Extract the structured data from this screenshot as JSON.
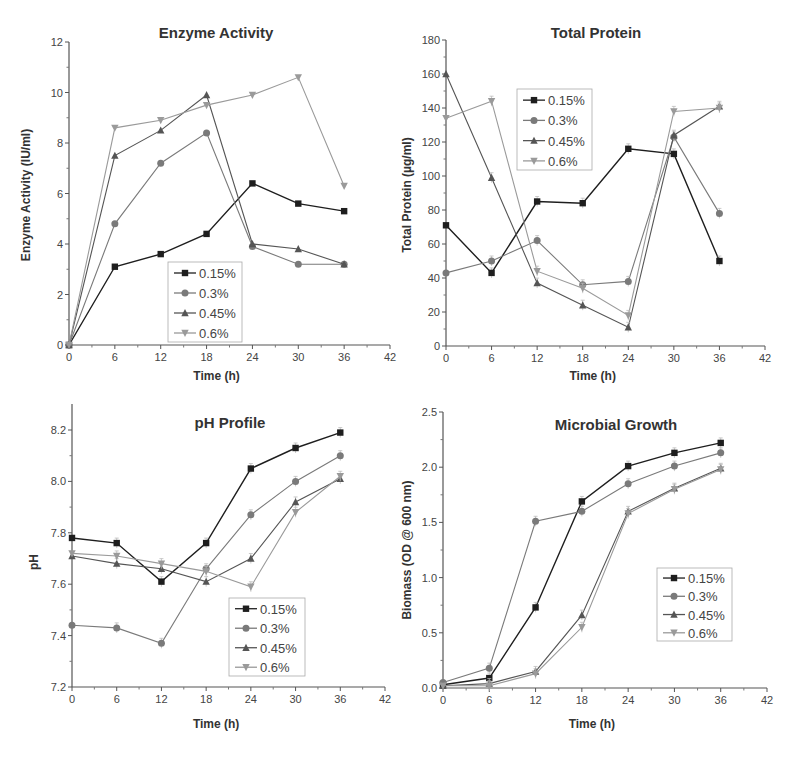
{
  "figure": {
    "series_styles": [
      {
        "name": "0.15%",
        "color": "#1e1e1e",
        "marker": "square"
      },
      {
        "name": "0.3%",
        "color": "#7a7a7a",
        "marker": "circle"
      },
      {
        "name": "0.45%",
        "color": "#555555",
        "marker": "triangle-up"
      },
      {
        "name": "0.6%",
        "color": "#9a9a9a",
        "marker": "triangle-down"
      }
    ]
  },
  "chart_data": [
    {
      "type": "line",
      "title": "Enzyme Activity",
      "xlabel": "Time (h)",
      "ylabel": "Enzyme Activity (IU/ml)",
      "x": [
        0,
        6,
        12,
        18,
        24,
        30,
        36
      ],
      "xlim": [
        0,
        42
      ],
      "ylim": [
        0,
        12
      ],
      "xticks": [
        "0",
        "6",
        "12",
        "18",
        "24",
        "30",
        "36",
        "42"
      ],
      "yticks": [
        "0",
        "2",
        "4",
        "6",
        "8",
        "10",
        "12"
      ],
      "legend_position": "lower center",
      "grid": false,
      "series": [
        {
          "name": "0.15%",
          "values": [
            0,
            3.1,
            3.6,
            4.4,
            6.4,
            5.6,
            5.3
          ]
        },
        {
          "name": "0.3%",
          "values": [
            0,
            4.8,
            7.2,
            8.4,
            3.9,
            3.2,
            3.2
          ]
        },
        {
          "name": "0.45%",
          "values": [
            0,
            7.5,
            8.5,
            9.9,
            4.0,
            3.8,
            3.2
          ]
        },
        {
          "name": "0.6%",
          "values": [
            0,
            8.6,
            8.9,
            9.5,
            9.9,
            10.6,
            6.3
          ]
        }
      ]
    },
    {
      "type": "line",
      "title": "Total Protein",
      "xlabel": "Time (h)",
      "ylabel": "Total Protein (µg/ml)",
      "x": [
        0,
        6,
        12,
        18,
        24,
        30,
        36
      ],
      "xlim": [
        0,
        42
      ],
      "ylim": [
        0,
        180
      ],
      "xticks": [
        "0",
        "6",
        "12",
        "18",
        "24",
        "30",
        "36",
        "42"
      ],
      "yticks": [
        "0",
        "20",
        "40",
        "60",
        "80",
        "100",
        "120",
        "140",
        "160",
        "180"
      ],
      "legend_position": "upper left",
      "grid": false,
      "error_bars": true,
      "series": [
        {
          "name": "0.15%",
          "values": [
            71,
            43,
            85,
            84,
            116,
            113,
            50
          ]
        },
        {
          "name": "0.3%",
          "values": [
            43,
            50,
            62,
            36,
            38,
            123,
            78
          ]
        },
        {
          "name": "0.45%",
          "values": [
            160,
            99,
            37,
            24,
            11,
            124,
            141
          ]
        },
        {
          "name": "0.6%",
          "values": [
            134,
            144,
            44,
            34,
            18,
            138,
            140
          ]
        }
      ]
    },
    {
      "type": "line",
      "title": "pH Profile",
      "xlabel": "Time (h)",
      "ylabel": "pH",
      "x": [
        0,
        6,
        12,
        18,
        24,
        30,
        36
      ],
      "xlim": [
        0,
        42
      ],
      "ylim": [
        7.2,
        8.3
      ],
      "xticks": [
        "0",
        "6",
        "12",
        "18",
        "24",
        "30",
        "36",
        "42"
      ],
      "yticks": [
        "7.2",
        "7.4",
        "7.6",
        "7.8",
        "8.0",
        "8.2"
      ],
      "legend_position": "lower right",
      "grid": false,
      "error_bars": true,
      "series": [
        {
          "name": "0.15%",
          "values": [
            7.78,
            7.76,
            7.61,
            7.76,
            8.05,
            8.13,
            8.19
          ]
        },
        {
          "name": "0.3%",
          "values": [
            7.44,
            7.43,
            7.37,
            7.66,
            7.87,
            8.0,
            8.1
          ]
        },
        {
          "name": "0.45%",
          "values": [
            7.71,
            7.68,
            7.66,
            7.61,
            7.7,
            7.92,
            8.01
          ]
        },
        {
          "name": "0.6%",
          "values": [
            7.72,
            7.71,
            7.68,
            7.65,
            7.59,
            7.88,
            8.02
          ]
        }
      ]
    },
    {
      "type": "line",
      "title": "Microbial Growth",
      "xlabel": "Time (h)",
      "ylabel": "Biomass (OD @ 600 nm)",
      "x": [
        0,
        6,
        12,
        18,
        24,
        30,
        36
      ],
      "xlim": [
        0,
        42
      ],
      "ylim": [
        0,
        2.5
      ],
      "xticks": [
        "0",
        "6",
        "12",
        "18",
        "24",
        "30",
        "36",
        "42"
      ],
      "yticks": [
        "0.0",
        "0.5",
        "1.0",
        "1.5",
        "2.0",
        "2.5"
      ],
      "legend_position": "center right",
      "grid": false,
      "error_bars": true,
      "series": [
        {
          "name": "0.15%",
          "values": [
            0.03,
            0.09,
            0.73,
            1.69,
            2.01,
            2.13,
            2.22
          ]
        },
        {
          "name": "0.3%",
          "values": [
            0.05,
            0.18,
            1.51,
            1.6,
            1.85,
            2.01,
            2.13
          ]
        },
        {
          "name": "0.45%",
          "values": [
            0.02,
            0.04,
            0.15,
            0.66,
            1.6,
            1.81,
            1.99
          ]
        },
        {
          "name": "0.6%",
          "values": [
            0.02,
            0.02,
            0.13,
            0.55,
            1.58,
            1.8,
            1.98
          ]
        }
      ]
    }
  ]
}
